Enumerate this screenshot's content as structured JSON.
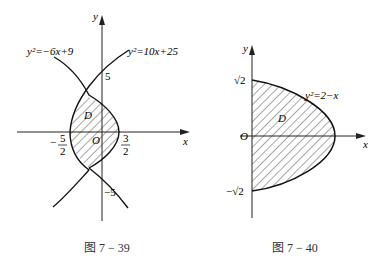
{
  "figures": [
    {
      "id": "fig-7-39",
      "caption": "图 7 − 39",
      "axis_x_label": "x",
      "axis_y_label": "y",
      "origin_label": "O",
      "curve_left_label": "y²=−6x+9",
      "curve_right_label": "y²=10x+25",
      "region_label": "D",
      "tick_y_top": "5",
      "tick_y_bottom": "−5",
      "tick_x_left_num": "5",
      "tick_x_left_den": "2",
      "tick_x_left_sign": "−",
      "tick_x_right_num": "3",
      "tick_x_right_den": "2"
    },
    {
      "id": "fig-7-40",
      "caption": "图 7 − 40",
      "axis_x_label": "x",
      "axis_y_label": "y",
      "origin_label": "O",
      "curve_label": "y²=2−x",
      "region_label": "D",
      "tick_y_top": "√2",
      "tick_y_bottom": "−√2"
    }
  ]
}
